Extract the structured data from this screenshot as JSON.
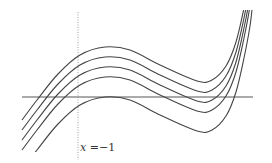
{
  "figure": {
    "label": {
      "var": "x",
      "text": " =−1"
    },
    "colors": {
      "curve": "#444444",
      "axis": "#555555",
      "dotted": "#888888",
      "background": "#ffffff"
    },
    "curve_offsets": [
      0,
      20,
      30,
      40,
      50
    ]
  }
}
